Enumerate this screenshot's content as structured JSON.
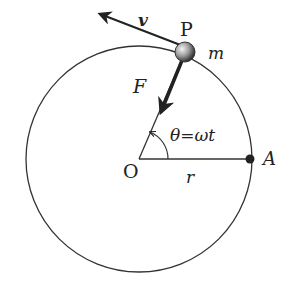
{
  "diagram": {
    "labels": {
      "particle": "P",
      "mass": "m",
      "velocity": "v",
      "force": "F",
      "angle": "θ=ωt",
      "center": "O",
      "radius": "r",
      "reference_point": "A"
    },
    "geometry": {
      "center": [
        139,
        159
      ],
      "radius": 113,
      "particle_pos": [
        185,
        52
      ],
      "point_A": [
        250,
        159
      ]
    },
    "colors": {
      "stroke": "#333333",
      "particle_fill": "#888888"
    }
  }
}
